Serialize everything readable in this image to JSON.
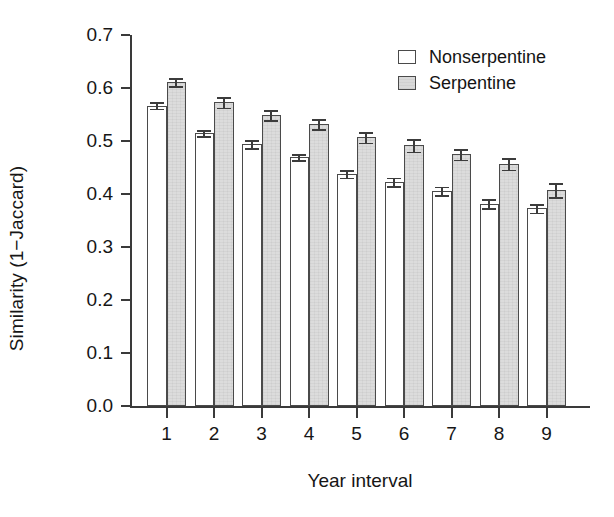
{
  "chart_data": {
    "type": "bar",
    "title": "",
    "subtitle": "",
    "xlabel": "Year interval",
    "ylabel": "Similarity (1−Jaccard)",
    "categories": [
      "1",
      "2",
      "3",
      "4",
      "5",
      "6",
      "7",
      "8",
      "9"
    ],
    "ylim": [
      0.0,
      0.7
    ],
    "yticks": [
      "0.0",
      "0.1",
      "0.2",
      "0.3",
      "0.4",
      "0.5",
      "0.6",
      "0.7"
    ],
    "ytick_values": [
      0.0,
      0.1,
      0.2,
      0.3,
      0.4,
      0.5,
      0.6,
      0.7
    ],
    "grid": false,
    "legend_position": "top-right",
    "error_bars": "standard error",
    "series": [
      {
        "name": "Nonserpentine",
        "color": "#ffffff",
        "values": [
          0.567,
          0.515,
          0.494,
          0.47,
          0.438,
          0.423,
          0.406,
          0.382,
          0.373
        ],
        "errors": [
          0.006,
          0.006,
          0.007,
          0.006,
          0.007,
          0.008,
          0.008,
          0.008,
          0.008
        ]
      },
      {
        "name": "Serpentine",
        "color": "#dcdcdc",
        "values": [
          0.611,
          0.573,
          0.549,
          0.532,
          0.507,
          0.492,
          0.475,
          0.457,
          0.407
        ],
        "errors": [
          0.008,
          0.01,
          0.009,
          0.009,
          0.01,
          0.012,
          0.01,
          0.011,
          0.013
        ]
      }
    ]
  },
  "legend": {
    "items": [
      {
        "label": "Nonserpentine",
        "swatch": "nonserp"
      },
      {
        "label": "Serpentine",
        "swatch": "serp"
      }
    ]
  },
  "axes": {
    "y_label": "Similarity (1−Jaccard)",
    "x_label": "Year interval"
  }
}
